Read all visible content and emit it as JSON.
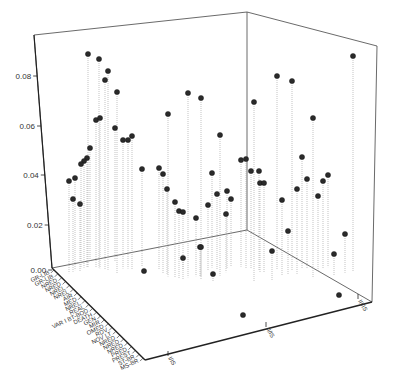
{
  "chart_data": {
    "type": "scatter",
    "subtype": "3d-needle",
    "title": "",
    "zlabel": "",
    "zlim": [
      0,
      0.09
    ],
    "z_ticks": [
      "0.00",
      "0.02",
      "0.04",
      "0.06",
      "0.08"
    ],
    "x_ticks": [
      "I/IS",
      "II/IS",
      "III/IS"
    ],
    "depth_tick_labels": [
      "GR-LIB",
      "GR-LIB",
      "NRED",
      "NRED",
      "NREL",
      "NREL",
      "AIR",
      "MED",
      "NREL",
      "REAL",
      "VAR I BT-BOD",
      "DEATH",
      "GEN",
      "MIR",
      "OMED",
      "RDV",
      "NOV LT",
      "NRED",
      "NRED",
      "NRED",
      "PRED",
      "PREST",
      "ST-BR",
      "MS-BR"
    ],
    "grid": false,
    "legend": null,
    "series": [
      {
        "name": "I/IS",
        "points": [
          {
            "sx": 88,
            "sy": 54,
            "z": 0.088
          },
          {
            "sx": 99,
            "sy": 59,
            "z": 0.086
          },
          {
            "sx": 108,
            "sy": 71,
            "z": 0.082
          },
          {
            "sx": 105,
            "sy": 80,
            "z": 0.078
          },
          {
            "sx": 117,
            "sy": 92,
            "z": 0.075
          },
          {
            "sx": 96,
            "sy": 120,
            "z": 0.061
          },
          {
            "sx": 100,
            "sy": 118,
            "z": 0.062
          },
          {
            "sx": 115,
            "sy": 128,
            "z": 0.055
          },
          {
            "sx": 123,
            "sy": 140,
            "z": 0.053
          },
          {
            "sx": 128,
            "sy": 140,
            "z": 0.053
          },
          {
            "sx": 132,
            "sy": 136,
            "z": 0.055
          },
          {
            "sx": 90,
            "sy": 148,
            "z": 0.047
          },
          {
            "sx": 87,
            "sy": 158,
            "z": 0.045
          },
          {
            "sx": 84,
            "sy": 161,
            "z": 0.044
          },
          {
            "sx": 81,
            "sy": 164,
            "z": 0.043
          },
          {
            "sx": 69,
            "sy": 181,
            "z": 0.038
          },
          {
            "sx": 75,
            "sy": 178,
            "z": 0.038
          },
          {
            "sx": 73,
            "sy": 199,
            "z": 0.03
          },
          {
            "sx": 80,
            "sy": 204,
            "z": 0.028
          },
          {
            "sx": 142,
            "sy": 169,
            "z": 0.04
          },
          {
            "sx": 144,
            "sy": 271,
            "z": 0.001
          }
        ]
      },
      {
        "name": "II/IS",
        "points": [
          {
            "sx": 188,
            "sy": 93,
            "z": 0.076
          },
          {
            "sx": 201,
            "sy": 98,
            "z": 0.075
          },
          {
            "sx": 168,
            "sy": 114,
            "z": 0.067
          },
          {
            "sx": 220,
            "sy": 135,
            "z": 0.058
          },
          {
            "sx": 159,
            "sy": 168,
            "z": 0.042
          },
          {
            "sx": 163,
            "sy": 174,
            "z": 0.041
          },
          {
            "sx": 167,
            "sy": 189,
            "z": 0.035
          },
          {
            "sx": 175,
            "sy": 202,
            "z": 0.031
          },
          {
            "sx": 179,
            "sy": 211,
            "z": 0.028
          },
          {
            "sx": 183,
            "sy": 212,
            "z": 0.028
          },
          {
            "sx": 196,
            "sy": 218,
            "z": 0.024
          },
          {
            "sx": 212,
            "sy": 173,
            "z": 0.039
          },
          {
            "sx": 217,
            "sy": 194,
            "z": 0.031
          },
          {
            "sx": 208,
            "sy": 205,
            "z": 0.027
          },
          {
            "sx": 227,
            "sy": 191,
            "z": 0.032
          },
          {
            "sx": 231,
            "sy": 199,
            "z": 0.028
          },
          {
            "sx": 226,
            "sy": 214,
            "z": 0.024
          },
          {
            "sx": 241,
            "sy": 160,
            "z": 0.044
          },
          {
            "sx": 246,
            "sy": 159,
            "z": 0.045
          },
          {
            "sx": 251,
            "sy": 171,
            "z": 0.04
          },
          {
            "sx": 200,
            "sy": 247,
            "z": 0.012
          },
          {
            "sx": 201,
            "sy": 247,
            "z": 0.012
          },
          {
            "sx": 183,
            "sy": 258,
            "z": 0.005
          },
          {
            "sx": 213,
            "sy": 274,
            "z": 0.003
          },
          {
            "sx": 243,
            "sy": 315,
            "z": 0.001
          }
        ]
      },
      {
        "name": "III/IS",
        "points": [
          {
            "sx": 254,
            "sy": 102,
            "z": 0.074
          },
          {
            "sx": 277,
            "sy": 76,
            "z": 0.08
          },
          {
            "sx": 292,
            "sy": 81,
            "z": 0.078
          },
          {
            "sx": 313,
            "sy": 118,
            "z": 0.066
          },
          {
            "sx": 260,
            "sy": 183,
            "z": 0.037
          },
          {
            "sx": 264,
            "sy": 183,
            "z": 0.037
          },
          {
            "sx": 259,
            "sy": 171,
            "z": 0.041
          },
          {
            "sx": 282,
            "sy": 200,
            "z": 0.031
          },
          {
            "sx": 302,
            "sy": 157,
            "z": 0.046
          },
          {
            "sx": 297,
            "sy": 189,
            "z": 0.035
          },
          {
            "sx": 307,
            "sy": 179,
            "z": 0.037
          },
          {
            "sx": 318,
            "sy": 196,
            "z": 0.031
          },
          {
            "sx": 323,
            "sy": 181,
            "z": 0.036
          },
          {
            "sx": 328,
            "sy": 175,
            "z": 0.038
          },
          {
            "sx": 353,
            "sy": 56,
            "z": 0.089
          },
          {
            "sx": 288,
            "sy": 231,
            "z": 0.018
          },
          {
            "sx": 272,
            "sy": 251,
            "z": 0.012
          },
          {
            "sx": 334,
            "sy": 254,
            "z": 0.009
          },
          {
            "sx": 345,
            "sy": 234,
            "z": 0.016
          },
          {
            "sx": 339,
            "sy": 295,
            "z": 0.001
          }
        ]
      }
    ]
  },
  "axes": {
    "z_ticks": [
      {
        "label": "0.00",
        "y": 270
      },
      {
        "label": "0.02",
        "y": 225
      },
      {
        "label": "0.04",
        "y": 175
      },
      {
        "label": "0.06",
        "y": 126
      },
      {
        "label": "0.08",
        "y": 76
      }
    ],
    "x_ticks": [
      {
        "label": "I/IS",
        "x": 168,
        "y": 354
      },
      {
        "label": "II/IS",
        "x": 266,
        "y": 325
      },
      {
        "label": "III/IS",
        "x": 358,
        "y": 297
      }
    ]
  }
}
